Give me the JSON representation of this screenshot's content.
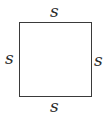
{
  "diagram": {
    "shape": "square",
    "border_color": "#3a3a3a",
    "side_labels": {
      "top": "s",
      "left": "s",
      "right": "s",
      "bottom": "s"
    }
  }
}
